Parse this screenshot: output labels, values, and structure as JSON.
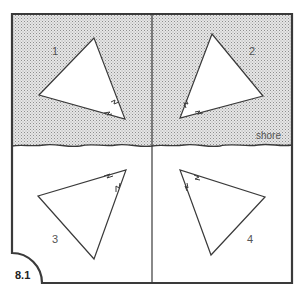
{
  "figure": {
    "label": "8.1",
    "shore_label": "shore",
    "colors": {
      "line": "#333333",
      "sea_fill": "#e4e4e4",
      "sea_dots": "#9a9a9a",
      "land_fill": "#ffffff",
      "text": "#555555"
    }
  },
  "quadrants": [
    {
      "number": "1",
      "region": "sea",
      "position": "top-left"
    },
    {
      "number": "2",
      "region": "sea",
      "position": "top-right"
    },
    {
      "number": "3",
      "region": "land",
      "position": "bottom-left"
    },
    {
      "number": "4",
      "region": "land",
      "position": "bottom-right"
    }
  ],
  "triangles": [
    {
      "quadrant": "1",
      "tip_direction": "down-right (toward shore)"
    },
    {
      "quadrant": "2",
      "tip_direction": "down-left (toward shore)"
    },
    {
      "quadrant": "3",
      "tip_direction": "up-right (toward shore)"
    },
    {
      "quadrant": "4",
      "tip_direction": "up-left (toward shore)"
    }
  ]
}
